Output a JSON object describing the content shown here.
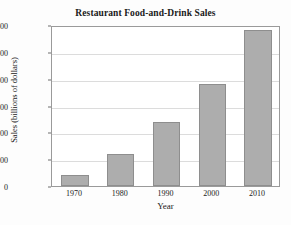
{
  "chart_data": {
    "type": "bar",
    "title": "Restaurant Food-and-Drink Sales",
    "xlabel": "Year",
    "ylabel": "Sales (billions of dollars)",
    "categories": [
      "1970",
      "1980",
      "1990",
      "2000",
      "2010"
    ],
    "values": [
      42,
      120,
      240,
      380,
      580
    ],
    "ylim": [
      0,
      600
    ],
    "yticks": [
      "0",
      "100",
      "200",
      "300",
      "400",
      "500",
      "600"
    ],
    "ytick_values": [
      0,
      100,
      200,
      300,
      400,
      500,
      600
    ],
    "grid": "horizontal",
    "legend": "none",
    "bar_color": "#adadad",
    "bar_edge_color": "#8e8e8e",
    "grid_color": "#dcdcdc",
    "frame_color": "#9a9a9a",
    "background_color": "#ffffff",
    "text_color": "#1a1a1a"
  }
}
